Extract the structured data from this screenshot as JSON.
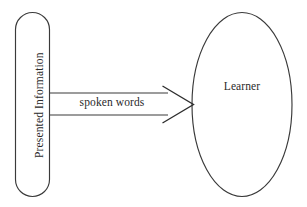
{
  "diagram": {
    "canvas": {
      "width": 307,
      "height": 207,
      "background": "#ffffff",
      "stroke_color": "#3a3a3a",
      "text_color": "#2a2a2a"
    },
    "nodes": [
      {
        "id": "presented-information",
        "label": "Presented Information",
        "shape": "rounded-rectangle",
        "text_orientation": "vertical-bottom-to-top",
        "x": 15,
        "y": 12,
        "width": 35,
        "height": 185,
        "corner_radius": 17
      },
      {
        "id": "learner",
        "label": "Learner",
        "shape": "ellipse",
        "text_orientation": "horizontal",
        "cx": 242,
        "cy": 104,
        "rx": 50,
        "ry": 92
      }
    ],
    "connector": {
      "id": "spoken-words-arrow",
      "label": "spoken words",
      "style": "double-line-open-arrow",
      "from": "presented-information",
      "to": "learner",
      "line_top_y": 93,
      "line_bottom_y": 115,
      "start_x": 50,
      "end_x": 167,
      "arrow_apex_x": 193,
      "arrow_apex_y": 104,
      "arrow_tail_top": [
        163,
        86
      ],
      "arrow_tail_bottom": [
        163,
        123
      ]
    }
  }
}
